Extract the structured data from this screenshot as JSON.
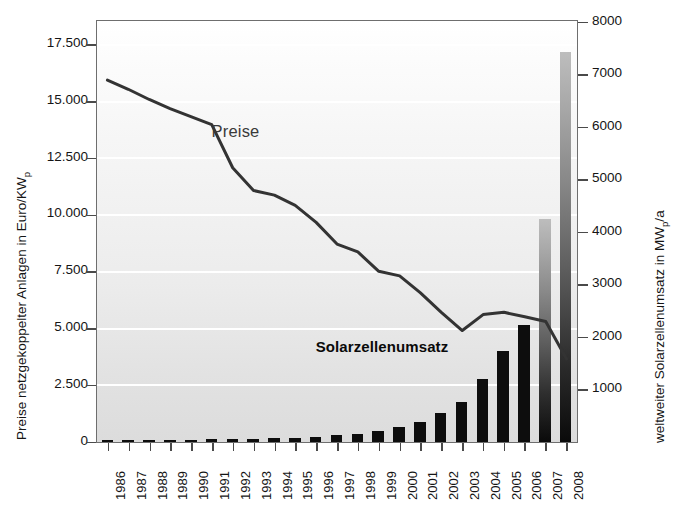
{
  "chart_data": {
    "type": "bar",
    "title": "",
    "subtitle": "",
    "xlabel": "",
    "grid": true,
    "legend_position": "none",
    "categories": [
      "1986",
      "1987",
      "1988",
      "1989",
      "1990",
      "1991",
      "1992",
      "1993",
      "1994",
      "1995",
      "1996",
      "1997",
      "1998",
      "1999",
      "2000",
      "2001",
      "2002",
      "2003",
      "2004",
      "2005",
      "2006",
      "2007",
      "2008"
    ],
    "axes": {
      "left": {
        "label_parts": {
          "text": "Preise netzgekoppelter Anlagen in Euro/KW",
          "subscript": "p"
        },
        "label": "Preise netzgekoppelter Anlagen in Euro/KWp",
        "ticks": [
          "0",
          "2.500",
          "5.000",
          "7.500",
          "10.000",
          "12.500",
          "15.000",
          "17.500"
        ],
        "tick_values": [
          0,
          2500,
          5000,
          7500,
          10000,
          12500,
          15000,
          17500
        ],
        "min": 0,
        "max": 18500,
        "unit": "Euro/KWp"
      },
      "right": {
        "label_parts": {
          "text": "weltweiter Solarzellenumsatz in MW",
          "subscript": "p",
          "suffix": "/a"
        },
        "label": "weltweiter Solarzellenumsatz in MWp/a",
        "ticks": [
          "1000",
          "2000",
          "3000",
          "4000",
          "5000",
          "6000",
          "7000",
          "8000"
        ],
        "tick_values": [
          1000,
          2000,
          3000,
          4000,
          5000,
          6000,
          7000,
          8000
        ],
        "min": 0,
        "max": 8000,
        "unit": "MWp/a"
      }
    },
    "series": [
      {
        "name": "Solarzellenumsatz",
        "type": "bar",
        "axis": "right",
        "unit": "MWp/a",
        "color": "#0d0d0d",
        "projected_color_top": "#bdbdbd",
        "projected_color_bottom": "#0a0a0a",
        "values": [
          26,
          29,
          34,
          40,
          46,
          55,
          58,
          60,
          69,
          78,
          89,
          126,
          155,
          201,
          288,
          391,
          562,
          760,
          1195,
          1727,
          2230,
          4250,
          7420
        ],
        "projected_flags": [
          false,
          false,
          false,
          false,
          false,
          false,
          false,
          false,
          false,
          false,
          false,
          false,
          false,
          false,
          false,
          false,
          false,
          false,
          false,
          false,
          false,
          true,
          true
        ]
      },
      {
        "name": "Preise",
        "type": "line",
        "axis": "left",
        "unit": "Euro/KWp",
        "color": "#333333",
        "values": [
          15900,
          15500,
          15050,
          14650,
          14300,
          13950,
          12050,
          11050,
          10850,
          10400,
          9650,
          8700,
          8350,
          7500,
          7300,
          6550,
          5700,
          4900,
          5600,
          5700,
          5500,
          5300,
          3650
        ]
      }
    ],
    "annotations": [
      {
        "name": "preise-label",
        "text": "Preise",
        "style": "plain",
        "x_year": "1991",
        "value": 13600
      },
      {
        "name": "solarzellenumsatz-label",
        "text": "Solarzellenumsatz",
        "style": "bold",
        "x_year": "1996",
        "value": 4100
      }
    ]
  }
}
